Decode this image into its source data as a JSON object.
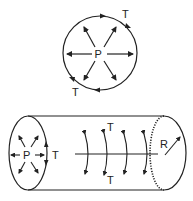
{
  "figure": {
    "top_diagram": {
      "description": "Circle cross-section with outward pressure arrows and tangential tension arrows",
      "labels": {
        "pressure": "P",
        "tension_top": "T",
        "tension_bottom": "T"
      }
    },
    "bottom_diagram": {
      "description": "Cylinder with pressure at end cap, circumferential tension arcs along length, radius R at far end",
      "labels": {
        "pressure": "P",
        "tension_end": "T",
        "tension_top": "T",
        "tension_bottom": "T",
        "radius": "R"
      }
    },
    "colors": {
      "stroke": "#222222",
      "background": "#ffffff"
    }
  }
}
